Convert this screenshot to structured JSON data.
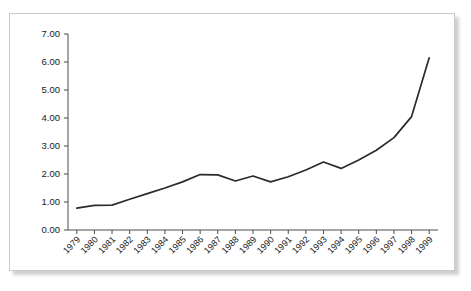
{
  "chart_data": {
    "type": "line",
    "title": "",
    "xlabel": "",
    "ylabel": "",
    "categories": [
      "1979",
      "1980",
      "1981",
      "1982",
      "1983",
      "1984",
      "1985",
      "1986",
      "1987",
      "1988",
      "1989",
      "1990",
      "1991",
      "1992",
      "1993",
      "1994",
      "1995",
      "1996",
      "1997",
      "1998",
      "1999"
    ],
    "values": [
      0.78,
      0.88,
      0.89,
      1.1,
      1.3,
      1.5,
      1.72,
      1.98,
      1.97,
      1.75,
      1.93,
      1.72,
      1.9,
      2.14,
      2.43,
      2.2,
      2.5,
      2.85,
      3.3,
      4.05,
      6.15
    ],
    "series": [
      {
        "name": "series-1",
        "values": [
          0.78,
          0.88,
          0.89,
          1.1,
          1.3,
          1.5,
          1.72,
          1.98,
          1.97,
          1.75,
          1.93,
          1.72,
          1.9,
          2.14,
          2.43,
          2.2,
          2.5,
          2.85,
          3.3,
          4.05,
          6.15
        ]
      }
    ],
    "ylim": [
      0,
      7
    ],
    "xlim_categories": 21,
    "ytick_labels": [
      "0.00",
      "1.00",
      "2.00",
      "3.00",
      "4.00",
      "5.00",
      "6.00",
      "7.00"
    ],
    "ytick_values": [
      0,
      1,
      2,
      3,
      4,
      5,
      6,
      7
    ],
    "grid": false,
    "legend": false,
    "legend_position": "none",
    "line_color": "#2b2b2b",
    "axis_color": "#4d4d4d",
    "frame_color": "#c9c9c9",
    "background_color": "#ffffff",
    "xtick_label_rotation": -45
  }
}
